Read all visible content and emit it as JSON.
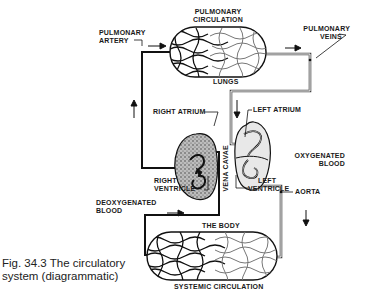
{
  "figure": {
    "caption_line1": "Fig. 34.3 The circulatory",
    "caption_line2": "system (diagrammatic)"
  },
  "labels": {
    "pulmonary_circulation_1": "PULMONARY",
    "pulmonary_circulation_2": "CIRCULATION",
    "pulmonary_artery_1": "PULMONARY",
    "pulmonary_artery_2": "ARTERY",
    "pulmonary_veins_1": "PULMONARY",
    "pulmonary_veins_2": "VEINS",
    "lungs": "LUNGS",
    "right_atrium": "RIGHT ATRIUM",
    "left_atrium": "LEFT ATRIUM",
    "vena_cavae": "VENA CAVAE",
    "oxygenated_blood_1": "OXYGENATED",
    "oxygenated_blood_2": "BLOOD",
    "right_ventricle_1": "RIGHT",
    "right_ventricle_2": "VENTRICLE",
    "left_ventricle_1": "LEFT",
    "left_ventricle_2": "VENTRICLE",
    "aorta": "AORTA",
    "deoxygenated_blood_1": "DEOXYGENATED",
    "deoxygenated_blood_2": "BLOOD",
    "the_body": "THE BODY",
    "systemic_circulation": "SYSTEMIC CIRCULATION"
  },
  "colors": {
    "deoxygenated_vessel": "#111111",
    "oxygenated_vessel": "#555555",
    "background": "#ffffff"
  }
}
